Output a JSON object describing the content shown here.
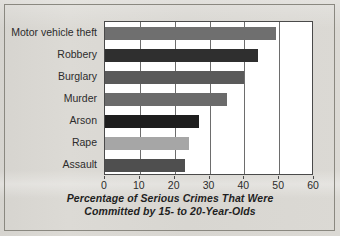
{
  "chart_data": {
    "type": "bar",
    "orientation": "horizontal",
    "title": "",
    "xlabel": "Percentage of Serious Crimes That Were Committed by 15- to 20-Year-Olds",
    "xlabel_lines": [
      "Percentage of Serious Crimes That Were",
      "Committed by 15- to 20-Year-Olds"
    ],
    "ylabel": "",
    "categories": [
      "Motor vehicle theft",
      "Robbery",
      "Burglary",
      "Murder",
      "Arson",
      "Rape",
      "Assault"
    ],
    "values": [
      49,
      44,
      40,
      35,
      27,
      24,
      23
    ],
    "bar_colors": [
      "#6f6f6f",
      "#2f2f2f",
      "#5a5a5a",
      "#6b6b6b",
      "#1e1e1e",
      "#a6a6a6",
      "#4f4f4f"
    ],
    "xlim": [
      0,
      60
    ],
    "xticks": [
      0,
      10,
      20,
      30,
      40,
      50,
      60
    ],
    "xtick_labels": [
      "0",
      "10",
      "20",
      "30",
      "40",
      "50",
      "60"
    ],
    "grid": "vertical",
    "legend": "none",
    "plot_background": "#ffffff",
    "page_background": "#d9d7d2",
    "axis_color": "#4a4a4a"
  }
}
